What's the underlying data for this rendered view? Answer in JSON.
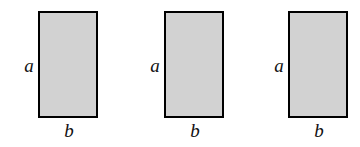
{
  "figure": {
    "background_color": "#ffffff",
    "rect_fill_color": "#d2d2d2",
    "rect_border_color": "#000000",
    "label_color": "#111111",
    "shapes": [
      {
        "name": "rectangle-1",
        "label_side": "a",
        "label_bottom": "b",
        "x": 38,
        "y": 11,
        "width": 60,
        "height": 107,
        "label_a_x": 21,
        "label_a_y": 56,
        "label_b_x": 61,
        "label_b_y": 121
      },
      {
        "name": "rectangle-2",
        "label_side": "a",
        "label_bottom": "b",
        "x": 164,
        "y": 11,
        "width": 60,
        "height": 107,
        "label_a_x": 147,
        "label_a_y": 56,
        "label_b_x": 187,
        "label_b_y": 121
      },
      {
        "name": "rectangle-3",
        "label_side": "a",
        "label_bottom": "b",
        "x": 288,
        "y": 11,
        "width": 60,
        "height": 107,
        "label_a_x": 271,
        "label_a_y": 56,
        "label_b_x": 311,
        "label_b_y": 121
      }
    ]
  }
}
